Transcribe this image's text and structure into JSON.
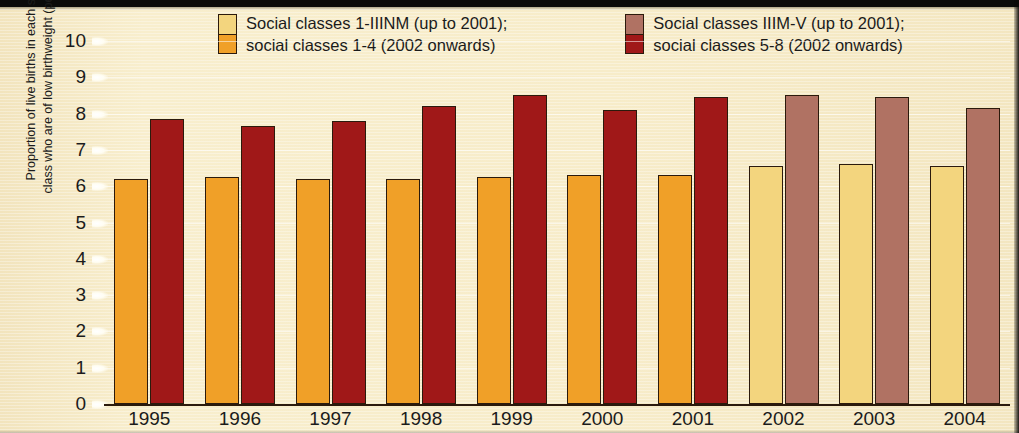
{
  "chart_data": {
    "type": "bar",
    "title": "",
    "xlabel": "",
    "ylabel_line1": "Proportion of live births in each social",
    "ylabel_line2": "class who are of low birthweight (per cent)",
    "ylim": [
      0,
      10
    ],
    "yticks": [
      "10",
      "9",
      "8",
      "7",
      "6",
      "5",
      "4",
      "3",
      "2",
      "1",
      "0"
    ],
    "grid": true,
    "legend_position": "top-center",
    "categories": [
      "1995",
      "1996",
      "1997",
      "1998",
      "1999",
      "2000",
      "2001",
      "2002",
      "2003",
      "2004"
    ],
    "series": [
      {
        "name": "Social classes 1-IIINM (up to 2001); social classes 1-4 (2002 onwards)",
        "values": [
          6.2,
          6.25,
          6.2,
          6.2,
          6.25,
          6.3,
          6.3,
          6.55,
          6.6,
          6.55
        ]
      },
      {
        "name": "Social classes IIIM-V (up to 2001); social classes 5-8 (2002 onwards)",
        "values": [
          7.85,
          7.65,
          7.8,
          8.2,
          8.5,
          8.1,
          8.45,
          8.5,
          8.45,
          8.15
        ]
      }
    ],
    "series_colors": {
      "light_old": "#f0a028",
      "dark_old": "#a01818",
      "light_new": "#f3d57e",
      "dark_new": "#b07263"
    },
    "note": "Bars for 1995-2001 use the darker orange/red palette; bars for 2002-2004 use the lighter pale-yellow/rose palette."
  },
  "legend": {
    "items": [
      {
        "line1": "Social classes 1-IIINM (up to 2001);",
        "line2": "social classes 1-4 (2002 onwards)",
        "swatch_top": "#f3d57e",
        "swatch_bottom": "#f0a028"
      },
      {
        "line1": "Social classes IIIM-V (up to 2001);",
        "line2": "social classes 5-8 (2002 onwards)",
        "swatch_top": "#b07263",
        "swatch_bottom": "#a01818"
      }
    ]
  },
  "colors": {
    "background": "#f7ecc9",
    "ink": "#1b1b1b",
    "bar_outline": "#2b1a0c"
  }
}
